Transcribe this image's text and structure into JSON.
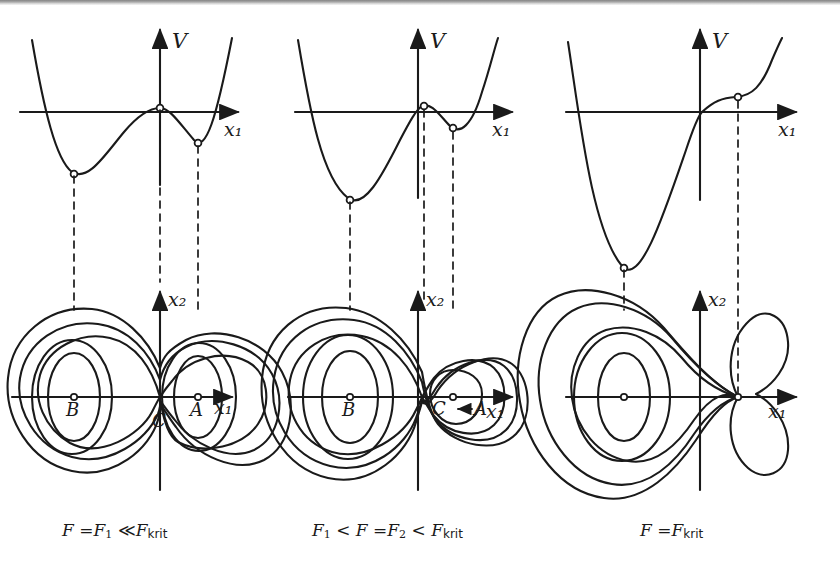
{
  "figure": {
    "axis_labels": {
      "v": "V",
      "x1": "x₁",
      "x2": "x₂"
    },
    "stroke_color": "#1a1a1a",
    "background_color": "#ffffff"
  },
  "panels": [
    {
      "id": "panel-1",
      "caption_plain": "F = F₁ ≪ F_krit",
      "caption_parts": {
        "lead": "F",
        "eq": "=",
        "sub1": "F",
        "sub1_idx": "1",
        "rel": "≪",
        "sub2": "F",
        "sub2_idx": "krit"
      },
      "potential": {
        "description": "Double-well potential with deep left minimum B, local maximum C at origin, and shallow right minimum A",
        "extrema": [
          {
            "label": "B",
            "type": "minimum",
            "x": -0.62,
            "v": -0.55
          },
          {
            "label": "C",
            "type": "maximum",
            "x": 0.0,
            "v": 0.0
          },
          {
            "label": "A",
            "type": "minimum",
            "x": 0.46,
            "v": -0.3
          }
        ]
      },
      "contour": {
        "description": "Symmetric figure-eight: two nested wells joined at a saddle at the origin",
        "critical_points": [
          {
            "label": "B",
            "type": "center",
            "x": -0.62,
            "y": 0.0
          },
          {
            "label": "C",
            "type": "saddle",
            "x": 0.0,
            "y": 0.0
          },
          {
            "label": "A",
            "type": "center",
            "x": 0.46,
            "y": 0.0
          }
        ],
        "level_count": 5
      },
      "annotation": null
    },
    {
      "id": "panel-2",
      "caption_plain": "F₁ < F = F₂ < F_krit",
      "caption_parts": {
        "lead": "F",
        "lead_idx": "1",
        "rel1": "<",
        "mid": "F",
        "eq": "=",
        "sub1": "F",
        "sub1_idx": "2",
        "rel2": "<",
        "sub2": "F",
        "sub2_idx": "krit"
      },
      "potential": {
        "description": "Local maximum C at origin with shallow minimum A moved closer and raised toward C",
        "extrema": [
          {
            "label": "B",
            "type": "minimum",
            "x": -0.62,
            "v": -0.55
          },
          {
            "label": "C",
            "type": "maximum",
            "x": 0.0,
            "v": 0.0
          },
          {
            "label": "A",
            "type": "minimum",
            "x": 0.3,
            "v": -0.09
          }
        ]
      },
      "contour": {
        "description": "Asymmetric figure-eight: large left well B, small right well A shrunk toward saddle C",
        "critical_points": [
          {
            "label": "B",
            "type": "center",
            "x": -0.62,
            "y": 0.0
          },
          {
            "label": "C",
            "type": "saddle",
            "x": 0.0,
            "y": 0.0
          },
          {
            "label": "A",
            "type": "center",
            "x": 0.3,
            "y": 0.0
          }
        ],
        "level_count": 5
      },
      "annotation": {
        "text": "C←A",
        "meaning": "minimum A migrating toward saddle C"
      }
    },
    {
      "id": "panel-3",
      "caption_plain": "F = F_krit",
      "caption_parts": {
        "lead": "F",
        "eq": "=",
        "sub2": "F",
        "sub2_idx": "krit"
      },
      "potential": {
        "description": "Minimum A and maximum C have merged into a horizontal inflection point; only the deep left minimum remains",
        "extrema": [
          {
            "label": "B",
            "type": "minimum",
            "x": -0.62,
            "v": -0.92
          },
          {
            "label": "A=C",
            "type": "inflection",
            "x": 0.3,
            "v": 0.1
          }
        ]
      },
      "contour": {
        "description": "Teardrop/cusp shape: the right well has collapsed into a cusp point where A and C coincide",
        "critical_points": [
          {
            "label": "B",
            "type": "center",
            "x": -0.62,
            "y": 0.0
          },
          {
            "label": "A=C",
            "type": "cusp",
            "x": 0.3,
            "y": 0.0
          }
        ],
        "level_count": 4
      },
      "annotation": null
    }
  ]
}
